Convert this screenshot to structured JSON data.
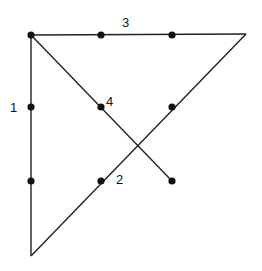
{
  "diagram": {
    "line_color": "#222222",
    "dot_color": "#111111",
    "dots": [
      {
        "x": 31,
        "y": 35
      },
      {
        "x": 101,
        "y": 35
      },
      {
        "x": 172,
        "y": 35
      },
      {
        "x": 31,
        "y": 107
      },
      {
        "x": 101,
        "y": 107
      },
      {
        "x": 172,
        "y": 107
      },
      {
        "x": 31,
        "y": 181
      },
      {
        "x": 101,
        "y": 181
      },
      {
        "x": 172,
        "y": 181
      }
    ],
    "lines": [
      {
        "label": "1",
        "x1": 31,
        "y1": 35,
        "x2": 31,
        "y2": 256,
        "lx": 10,
        "ly": 112
      },
      {
        "label": "2",
        "x1": 31,
        "y1": 256,
        "x2": 246,
        "y2": 34,
        "lx": 116,
        "ly": 184
      },
      {
        "label": "3",
        "x1": 246,
        "y1": 34,
        "x2": 31,
        "y2": 35,
        "lx": 122,
        "ly": 27
      },
      {
        "label": "4",
        "x1": 31,
        "y1": 35,
        "x2": 172,
        "y2": 181,
        "lx": 106,
        "ly": 106
      }
    ]
  }
}
